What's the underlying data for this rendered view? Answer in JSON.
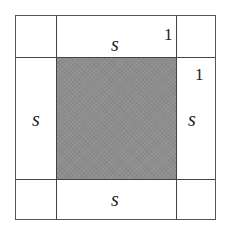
{
  "diagram": {
    "colors": {
      "line": "#444444",
      "shaded_center": "#8e8e8e",
      "background": "#ffffff",
      "text": "#222222"
    },
    "regions": {
      "center": {
        "shaded": true,
        "side": "s"
      },
      "top_strip": {
        "label": "s",
        "thickness_label": "1"
      },
      "right_strip": {
        "label": "s",
        "thickness_label": "1"
      },
      "bottom_strip": {
        "label": "s"
      },
      "left_strip": {
        "label": "s"
      },
      "corners": [
        "top-left",
        "top-right",
        "bottom-left",
        "bottom-right"
      ]
    },
    "labels": {
      "top_s": "s",
      "top_one": "1",
      "right_one": "1",
      "left_s": "s",
      "right_s": "s",
      "bottom_s": "s"
    }
  }
}
